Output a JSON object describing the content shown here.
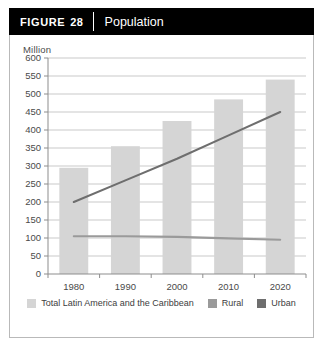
{
  "figure": {
    "tag_word": "FIGURE",
    "number": "28",
    "title": "Population"
  },
  "colors": {
    "header_background": "#000000",
    "header_text": "#ffffff",
    "card_border": "#b9b9b9",
    "gridline": "#c9c9c9",
    "axis": "#8d8d8d",
    "tick_text": "#4a4a4a",
    "bar": "#d5d5d5",
    "rural_line": "#9a9a9a",
    "urban_line": "#6e6e6e",
    "legend_text": "#3d3d3d"
  },
  "legend": {
    "position": "bottom-center",
    "entries": [
      {
        "label": "Total Latin America and the Caribbean",
        "color": "#d5d5d5",
        "kind": "bar"
      },
      {
        "label": "Rural",
        "color": "#9a9a9a",
        "kind": "line"
      },
      {
        "label": "Urban",
        "color": "#6e6e6e",
        "kind": "line"
      }
    ]
  },
  "chart_data": {
    "type": "bar",
    "title": "Population",
    "xlabel": "",
    "ylabel": "Million",
    "unit_label": "Million",
    "categories": [
      "1980",
      "1990",
      "2000",
      "2010",
      "2020"
    ],
    "x": [
      1980,
      1990,
      2000,
      2010,
      2020
    ],
    "ylim": [
      0,
      600
    ],
    "ytick_step": 50,
    "yticks": [
      0,
      50,
      100,
      150,
      200,
      250,
      300,
      350,
      400,
      450,
      500,
      550,
      600
    ],
    "ytick_labels": [
      "0",
      "50",
      "100",
      "150",
      "200",
      "250",
      "300",
      "350",
      "400",
      "450",
      "500",
      "550",
      "600"
    ],
    "xtick_labels": [
      "1980",
      "1990",
      "2000",
      "2010",
      "2020"
    ],
    "grid": true,
    "grid_axis": "y",
    "series": [
      {
        "name": "Total Latin America and the Caribbean",
        "type": "bar",
        "color": "#d5d5d5",
        "values": [
          295,
          355,
          425,
          485,
          540
        ]
      },
      {
        "name": "Urban",
        "type": "line",
        "color": "#6e6e6e",
        "values": [
          200,
          260,
          320,
          385,
          450
        ]
      },
      {
        "name": "Rural",
        "type": "line",
        "color": "#9a9a9a",
        "values": [
          105,
          105,
          103,
          99,
          95
        ]
      }
    ]
  }
}
